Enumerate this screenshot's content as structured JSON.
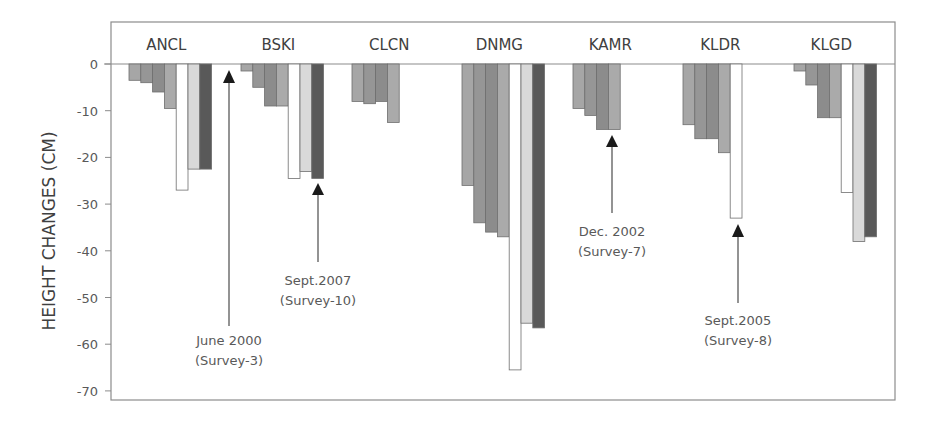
{
  "chart_data": {
    "type": "bar",
    "title": "",
    "xlabel": "",
    "ylabel": "HEIGHT CHANGES (CM)",
    "ylim": [
      -72,
      0
    ],
    "yticks": [
      0,
      -10,
      -20,
      -30,
      -40,
      -50,
      -60,
      -70
    ],
    "grid": false,
    "legend": null,
    "categories": [
      "ANCL",
      "BSKI",
      "CLCN",
      "DNMG",
      "KAMR",
      "KLDR",
      "KLGD"
    ],
    "bar_styles": [
      {
        "index": 0,
        "fill": "#a6a6a6"
      },
      {
        "index": 1,
        "fill": "#969696"
      },
      {
        "index": 2,
        "fill": "#8c8c8c"
      },
      {
        "index": 3,
        "fill": "#aaaaaa"
      },
      {
        "index": 4,
        "fill": "#ffffff"
      },
      {
        "index": 5,
        "fill": "#d9d9d9"
      },
      {
        "index": 6,
        "fill": "#595959"
      }
    ],
    "groups": [
      {
        "station": "ANCL",
        "values": [
          -3.5,
          -4,
          -6,
          -9.5,
          -27,
          -22.5,
          -22.5
        ]
      },
      {
        "station": "BSKI",
        "values": [
          -1.5,
          -5,
          -9,
          -9,
          -24.5,
          -23,
          -24.5
        ]
      },
      {
        "station": "CLCN",
        "values": [
          -8,
          -8.5,
          -8,
          -12.5
        ]
      },
      {
        "station": "DNMG",
        "values": [
          -26,
          -34,
          -36,
          -37,
          -65.5,
          -55.5,
          -56.5
        ]
      },
      {
        "station": "KAMR",
        "values": [
          -9.5,
          -11,
          -14,
          -14
        ]
      },
      {
        "station": "KLDR",
        "values": [
          -13,
          -16,
          -16,
          -19,
          -33
        ]
      },
      {
        "station": "KLGD",
        "values": [
          -1.5,
          -4.5,
          -11.5,
          -11.5,
          -27.5,
          -38,
          -37
        ]
      }
    ],
    "annotations": [
      {
        "text": [
          "June 2000",
          "(Survey-3)"
        ],
        "points_to": "BSKI survey start (zero line)"
      },
      {
        "text": [
          "Sept.2007",
          "(Survey-10)"
        ],
        "points_to": "BSKI last bar"
      },
      {
        "text": [
          "Dec. 2002",
          "(Survey-7)"
        ],
        "points_to": "KAMR last bar"
      },
      {
        "text": [
          "Sept.2005",
          "(Survey-8)"
        ],
        "points_to": "KLDR last bar"
      }
    ]
  },
  "labels": {
    "yaxis_title": "HEIGHT CHANGES (CM)",
    "ticks": [
      "0",
      "-10",
      "-20",
      "-30",
      "-40",
      "-50",
      "-60",
      "-70"
    ],
    "groups": [
      "ANCL",
      "BSKI",
      "CLCN",
      "DNMG",
      "KAMR",
      "KLDR",
      "KLGD"
    ],
    "anno": {
      "june2000": [
        "June 2000",
        "(Survey-3)"
      ],
      "sept2007": [
        "Sept.2007",
        "(Survey-10)"
      ],
      "dec2002": [
        "Dec. 2002",
        "(Survey-7)"
      ],
      "sept2005": [
        "Sept.2005",
        "(Survey-8)"
      ]
    }
  }
}
